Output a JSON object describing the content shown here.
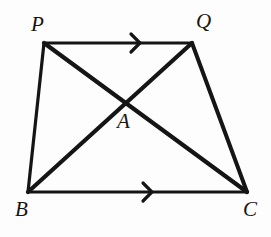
{
  "figure": {
    "kind": "geometry-diagram",
    "canvas": {
      "width": 271,
      "height": 237
    },
    "background_color": "#fdfdfd",
    "stroke_color": "#151515"
  },
  "points": {
    "P": {
      "label": "P",
      "x": 44,
      "y": 43,
      "label_x": 31,
      "label_y": 14
    },
    "Q": {
      "label": "Q",
      "x": 192,
      "y": 43,
      "label_x": 196,
      "label_y": 11
    },
    "B": {
      "label": "B",
      "x": 28,
      "y": 192,
      "label_x": 15,
      "label_y": 199
    },
    "C": {
      "label": "C",
      "x": 247,
      "y": 192,
      "label_x": 243,
      "label_y": 199
    },
    "A": {
      "label": "A",
      "x": 125,
      "y": 105,
      "label_x": 117,
      "label_y": 111
    }
  },
  "segments": [
    {
      "name": "side-PQ",
      "from": "P",
      "to": "Q",
      "width": 3.2,
      "marks": 1
    },
    {
      "name": "side-QC",
      "from": "Q",
      "to": "C",
      "width": 4.0,
      "marks": 0
    },
    {
      "name": "side-BC",
      "from": "B",
      "to": "C",
      "width": 3.2,
      "marks": 1
    },
    {
      "name": "side-PB",
      "from": "P",
      "to": "B",
      "width": 3.2,
      "marks": 0
    },
    {
      "name": "diagonal-PC",
      "from": "P",
      "to": "C",
      "width": 4.2,
      "marks": 0
    },
    {
      "name": "diagonal-BQ",
      "from": "B",
      "to": "Q",
      "width": 4.2,
      "marks": 0
    }
  ],
  "parallel_marks": [
    {
      "name": "arrow-mark-pq",
      "on": "side-PQ",
      "x": 140,
      "y": 43,
      "size": 9,
      "direction": "right"
    },
    {
      "name": "arrow-mark-bc",
      "on": "side-BC",
      "x": 152,
      "y": 192,
      "size": 9,
      "direction": "right"
    }
  ]
}
